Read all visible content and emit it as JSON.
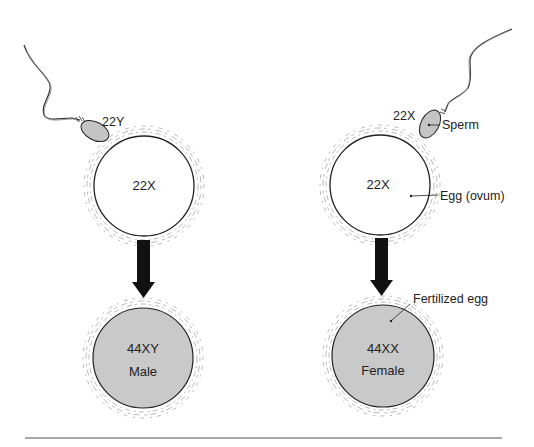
{
  "diagram": {
    "colors": {
      "fertilized_fill": "#c9c9c9",
      "sperm_head_fill": "#c4c4c4",
      "outline": "#222222",
      "arrow": "#111111",
      "halo": "#9a9a9a"
    },
    "left": {
      "sperm_label": "22Y",
      "egg_label": "22X",
      "result_genotype": "44XY",
      "result_sex": "Male"
    },
    "right": {
      "sperm_label": "22X",
      "egg_label": "22X",
      "result_genotype": "44XX",
      "result_sex": "Female",
      "callouts": {
        "sperm": "Sperm",
        "egg": "Egg (ovum)",
        "fertilized": "Fertilized egg"
      }
    }
  }
}
